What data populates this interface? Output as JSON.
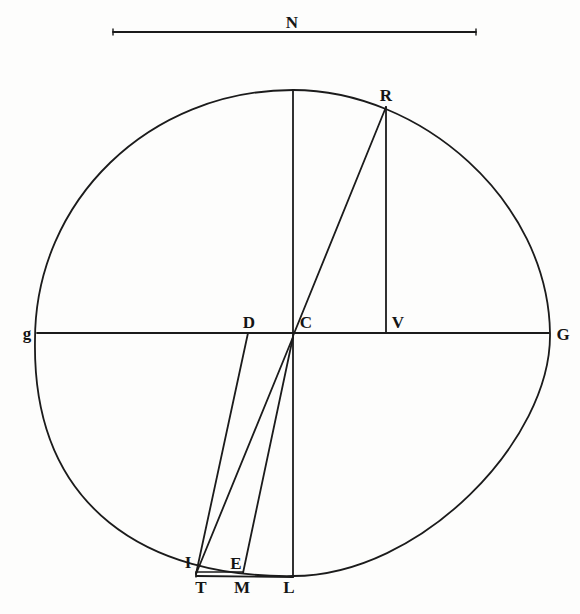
{
  "figure": {
    "type": "geometric construction",
    "stroke_color": "#1b1b1b",
    "background": "#fdfdfc"
  },
  "scale_bar": {
    "label": "N",
    "x1": 113,
    "y": 32,
    "x2": 476
  },
  "oval": {
    "top": [
      293,
      90
    ],
    "right": [
      550,
      333
    ],
    "bottom": [
      293,
      576
    ],
    "left": [
      35,
      340
    ]
  },
  "points": {
    "R": {
      "label": "R",
      "x": 386,
      "y": 107
    },
    "g": {
      "label": "g",
      "x": 37,
      "y": 333
    },
    "D": {
      "label": "D",
      "x": 248,
      "y": 333
    },
    "C": {
      "label": "C",
      "x": 293,
      "y": 333
    },
    "V": {
      "label": "V",
      "x": 386,
      "y": 333
    },
    "G": {
      "label": "G",
      "x": 549,
      "y": 333
    },
    "I": {
      "label": "I",
      "x": 196,
      "y": 572
    },
    "E": {
      "label": "E",
      "x": 243,
      "y": 572
    },
    "T": {
      "label": "T",
      "x": 196,
      "y": 577
    },
    "M": {
      "label": "M",
      "x": 243,
      "y": 577
    },
    "L": {
      "label": "L",
      "x": 293,
      "y": 577
    }
  },
  "segments": [
    {
      "name": "vertical-axis-upper",
      "from": "top",
      "to": "C"
    },
    {
      "name": "horizontal-axis-gG",
      "from": "g",
      "to": "G"
    },
    {
      "name": "line-CR",
      "from": "C",
      "to": "R"
    },
    {
      "name": "line-RV",
      "from": "R",
      "to": "V"
    },
    {
      "name": "line-DI",
      "from": "D",
      "to": "I"
    },
    {
      "name": "line-CI",
      "from": "C",
      "to": "I"
    },
    {
      "name": "line-CE",
      "from": "C",
      "to": "E"
    },
    {
      "name": "line-CL",
      "from": "C",
      "to": "L"
    },
    {
      "name": "line-IE",
      "from": "I",
      "to": "E"
    },
    {
      "name": "line-TL",
      "from": "T",
      "to": "L"
    }
  ]
}
